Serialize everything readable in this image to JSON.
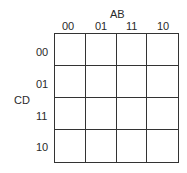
{
  "kmap": {
    "col_var": "AB",
    "row_var": "CD",
    "col_labels": [
      "00",
      "01",
      "11",
      "10"
    ],
    "row_labels": [
      "00",
      "01",
      "11",
      "10"
    ],
    "cells": [
      [
        "",
        "",
        "",
        ""
      ],
      [
        "",
        "",
        "",
        ""
      ],
      [
        "",
        "",
        "",
        ""
      ],
      [
        "",
        "",
        "",
        ""
      ]
    ]
  }
}
